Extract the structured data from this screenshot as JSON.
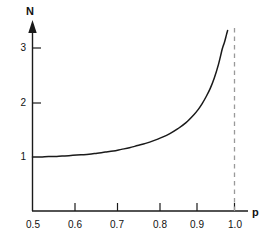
{
  "chart_data": {
    "type": "line",
    "title": "",
    "subtitle": "",
    "xlabel": "p",
    "ylabel": "N",
    "xlim": [
      0.5,
      1.04
    ],
    "ylim": [
      0,
      3.55
    ],
    "grid": false,
    "legend": null,
    "x_ticks": [
      0.5,
      0.6,
      0.7,
      0.8,
      0.9,
      1.0
    ],
    "x_tick_labels": [
      "0.5",
      "0.6",
      "0.7",
      "0.8",
      "0.9",
      "1.0"
    ],
    "y_ticks": [
      1,
      2,
      3
    ],
    "y_tick_labels": [
      "1",
      "2",
      "3"
    ],
    "series": [
      {
        "name": "N(p)",
        "x": [
          0.5,
          0.52,
          0.54,
          0.56,
          0.58,
          0.6,
          0.62,
          0.64,
          0.66,
          0.68,
          0.7,
          0.72,
          0.74,
          0.76,
          0.78,
          0.8,
          0.82,
          0.84,
          0.86,
          0.88,
          0.9,
          0.91,
          0.92,
          0.93,
          0.94,
          0.95,
          0.96,
          0.97,
          0.975,
          0.98,
          0.983
        ],
        "values": [
          1.0,
          1.0,
          1.01,
          1.01,
          1.02,
          1.03,
          1.04,
          1.05,
          1.07,
          1.09,
          1.11,
          1.14,
          1.17,
          1.21,
          1.25,
          1.3,
          1.36,
          1.43,
          1.52,
          1.63,
          1.78,
          1.87,
          1.98,
          2.11,
          2.26,
          2.45,
          2.69,
          2.99,
          3.1,
          3.24,
          3.32
        ]
      }
    ],
    "annotations": [
      {
        "name": "asymptote",
        "type": "vertical-dashed-line",
        "x": 1.0,
        "label": "",
        "color": "#999999"
      }
    ]
  },
  "axes": {
    "y_axis_label": "N",
    "x_axis_label": "p",
    "axis_color": "#1a1a1a",
    "curve_color": "#1a1a1a",
    "asymptote_color": "#999999"
  },
  "y_tick_labels": [
    {
      "text": "3"
    },
    {
      "text": "2"
    },
    {
      "text": "1"
    }
  ],
  "x_tick_labels": [
    {
      "text": "0.5"
    },
    {
      "text": "0.6"
    },
    {
      "text": "0.7"
    },
    {
      "text": "0.8"
    },
    {
      "text": "0.9"
    },
    {
      "text": "1.0"
    }
  ]
}
